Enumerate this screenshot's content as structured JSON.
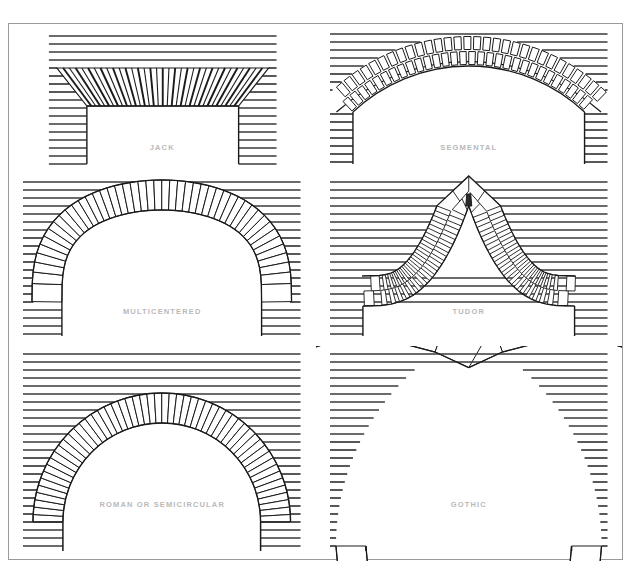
{
  "document": {
    "title": "Brick Arch Types",
    "kind": "architectural-reference-plate",
    "frame": {
      "border_color": "#9a9a9a",
      "background": "#ffffff"
    }
  },
  "style": {
    "ink": "#1a1a1a",
    "mortar_line": "#3a3a3a",
    "caption_color": "#b9b9b9",
    "paper": "#ffffff",
    "course_spacing_px": 8
  },
  "panels": [
    {
      "id": "jack",
      "label": "JACK",
      "row": 1,
      "col": 1,
      "arch_type": "jack",
      "description": "Flat (straight) arch with voussoirs fanning outward from a central keystone; horizontal brick coursing in the surrounding wall.",
      "springing_span_px": 222,
      "rise_px": 0,
      "voussoir_count": 34,
      "ring_courses": 1
    },
    {
      "id": "segmental",
      "label": "SEGMENTAL",
      "row": 1,
      "col": 2,
      "arch_type": "segmental",
      "description": "Shallow circular-segment arch built of two rings of rectangular bricks laid in a staggered pattern.",
      "springing_span_px": 232,
      "rise_px": 46,
      "voussoir_count": 30,
      "ring_courses": 2
    },
    {
      "id": "multicentered",
      "label": "MULTICENTERED",
      "row": 2,
      "col": 1,
      "arch_type": "multicentered",
      "description": "Flattened arch struck from several centres, giving a wide crown and tight haunches; single ring of radial voussoirs.",
      "springing_span_px": 200,
      "rise_px": 92,
      "voussoir_count": 46,
      "ring_courses": 1
    },
    {
      "id": "tudor",
      "label": "TUDOR",
      "row": 2,
      "col": 2,
      "arch_type": "tudor",
      "description": "Four-centred depressed arch rising to a slight point at the crown; multi-ring rectangular brick coursing.",
      "springing_span_px": 212,
      "rise_px": 100,
      "voussoir_count": 34,
      "ring_courses": 2
    },
    {
      "id": "roman",
      "label": "ROMAN OR SEMICIRCULAR",
      "row": 3,
      "col": 1,
      "arch_type": "semicircular",
      "description": "True half-circle arch; voussoirs radiate from a single centre at the springing line.",
      "springing_span_px": 198,
      "rise_px": 99,
      "voussoir_count": 54,
      "ring_courses": 1
    },
    {
      "id": "gothic",
      "label": "GOTHIC",
      "row": 3,
      "col": 2,
      "arch_type": "gothic-pointed",
      "description": "Two-centred pointed arch; two arcs meet at a sharp apex with voussoirs radiating from each centre.",
      "springing_span_px": 206,
      "rise_px": 150,
      "voussoir_count": 58,
      "ring_courses": 1
    }
  ]
}
